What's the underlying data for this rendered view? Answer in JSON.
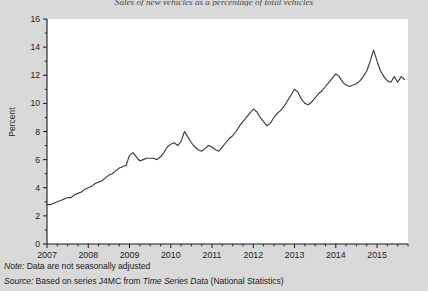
{
  "figure": {
    "title": "Sales of new vehicles as a percentage of total vehicles",
    "note_label": "Note:",
    "note_text": " Data are not seasonally adjusted",
    "source_label": "Source:",
    "source_text_1": " Based on series J4MC from ",
    "source_series": "Time Series Data",
    "source_text_2": " (National Statistics)",
    "line_color": "#3b3b3b",
    "plot_background": "#ffffff",
    "page_background": "#d9d9d9",
    "axis_color": "#1a1a1a"
  },
  "chart_data": {
    "type": "line",
    "title": "Sales of new vehicles as a percentage of total vehicles",
    "xlabel": "",
    "ylabel": "Percent",
    "ylim": [
      0,
      16
    ],
    "yticks": [
      0,
      2,
      4,
      6,
      8,
      10,
      12,
      14,
      16
    ],
    "xlim": [
      2007.0,
      2015.75
    ],
    "xticks": [
      2007,
      2008,
      2009,
      2010,
      2011,
      2012,
      2013,
      2014,
      2015
    ],
    "xtick_labels": [
      "2007",
      "2008",
      "2009",
      "2010",
      "2011",
      "2012",
      "2013",
      "2014",
      "2015"
    ],
    "minor_xticks_per_year": 4,
    "grid": false,
    "legend": null,
    "series": [
      {
        "name": "Percent",
        "x": [
          2007.0,
          2007.083,
          2007.167,
          2007.25,
          2007.333,
          2007.417,
          2007.5,
          2007.583,
          2007.667,
          2007.75,
          2007.833,
          2007.917,
          2008.0,
          2008.083,
          2008.167,
          2008.25,
          2008.333,
          2008.417,
          2008.5,
          2008.583,
          2008.667,
          2008.75,
          2008.833,
          2008.917,
          2009.0,
          2009.083,
          2009.167,
          2009.25,
          2009.333,
          2009.417,
          2009.5,
          2009.583,
          2009.667,
          2009.75,
          2009.833,
          2009.917,
          2010.0,
          2010.083,
          2010.167,
          2010.25,
          2010.333,
          2010.417,
          2010.5,
          2010.583,
          2010.667,
          2010.75,
          2010.833,
          2010.917,
          2011.0,
          2011.083,
          2011.167,
          2011.25,
          2011.333,
          2011.417,
          2011.5,
          2011.583,
          2011.667,
          2011.75,
          2011.833,
          2011.917,
          2012.0,
          2012.083,
          2012.167,
          2012.25,
          2012.333,
          2012.417,
          2012.5,
          2012.583,
          2012.667,
          2012.75,
          2012.833,
          2012.917,
          2013.0,
          2013.083,
          2013.167,
          2013.25,
          2013.333,
          2013.417,
          2013.5,
          2013.583,
          2013.667,
          2013.75,
          2013.833,
          2013.917,
          2014.0,
          2014.083,
          2014.167,
          2014.25,
          2014.333,
          2014.417,
          2014.5,
          2014.583,
          2014.667,
          2014.75,
          2014.833,
          2014.917,
          2015.0,
          2015.083,
          2015.167,
          2015.25,
          2015.333,
          2015.417,
          2015.5,
          2015.583,
          2015.667
        ],
        "y": [
          2.8,
          2.8,
          2.9,
          3.0,
          3.1,
          3.2,
          3.3,
          3.3,
          3.5,
          3.6,
          3.7,
          3.9,
          4.0,
          4.1,
          4.3,
          4.4,
          4.5,
          4.7,
          4.9,
          5.0,
          5.2,
          5.4,
          5.5,
          5.6,
          6.3,
          6.5,
          6.2,
          5.9,
          6.0,
          6.1,
          6.1,
          6.1,
          6.0,
          6.2,
          6.5,
          6.9,
          7.1,
          7.2,
          7.0,
          7.3,
          8.0,
          7.6,
          7.2,
          6.9,
          6.7,
          6.6,
          6.8,
          7.0,
          6.9,
          6.7,
          6.6,
          6.9,
          7.2,
          7.5,
          7.7,
          8.0,
          8.4,
          8.7,
          9.0,
          9.3,
          9.6,
          9.4,
          9.0,
          8.7,
          8.4,
          8.6,
          9.0,
          9.3,
          9.5,
          9.8,
          10.2,
          10.6,
          11.0,
          10.8,
          10.3,
          10.0,
          9.9,
          10.1,
          10.4,
          10.7,
          10.9,
          11.2,
          11.5,
          11.8,
          12.1,
          11.9,
          11.5,
          11.3,
          11.2,
          11.3,
          11.4,
          11.6,
          11.9,
          12.3,
          13.0,
          13.8,
          13.0,
          12.3,
          11.9,
          11.6,
          11.5,
          11.9,
          11.5,
          11.9,
          11.7
        ]
      }
    ]
  }
}
